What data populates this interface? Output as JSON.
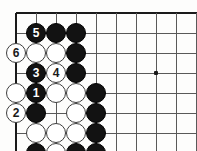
{
  "diagram": {
    "kind": "go-board-diagram",
    "board": {
      "origin_x": 16,
      "origin_y": 13,
      "spacing": 20,
      "cols": 10,
      "rows": 7,
      "left_edge": true,
      "top_edge": true,
      "line_color": "#595959",
      "edge_color": "#1a1a1a",
      "background_color": "#fdfdfc"
    },
    "star_points": [
      {
        "name": "star-point-4-4",
        "col": 7,
        "row": 3
      }
    ],
    "colors": {
      "black_stone": "#121212",
      "white_stone": "#ffffff",
      "black_label": "#ffffff",
      "white_label": "#1a1a1a"
    },
    "stones": [
      {
        "name": "stone-black-move-5",
        "color": "black",
        "col": 1,
        "row": 1,
        "label": "5"
      },
      {
        "name": "stone-black-b1",
        "color": "black",
        "col": 2,
        "row": 1,
        "label": ""
      },
      {
        "name": "stone-black-b2",
        "color": "black",
        "col": 3,
        "row": 1,
        "label": ""
      },
      {
        "name": "stone-white-move-6",
        "color": "white",
        "col": 0,
        "row": 2,
        "label": "6"
      },
      {
        "name": "stone-white-w1",
        "color": "white",
        "col": 1,
        "row": 2,
        "label": ""
      },
      {
        "name": "stone-white-w2",
        "color": "white",
        "col": 2,
        "row": 2,
        "label": ""
      },
      {
        "name": "stone-black-b3",
        "color": "black",
        "col": 3,
        "row": 2,
        "label": ""
      },
      {
        "name": "stone-black-move-3",
        "color": "black",
        "col": 1,
        "row": 3,
        "label": "3"
      },
      {
        "name": "stone-white-move-4",
        "color": "white",
        "col": 2,
        "row": 3,
        "label": "4"
      },
      {
        "name": "stone-black-b4",
        "color": "black",
        "col": 3,
        "row": 3,
        "label": ""
      },
      {
        "name": "stone-white-w3",
        "color": "white",
        "col": 0,
        "row": 4,
        "label": ""
      },
      {
        "name": "stone-black-move-1",
        "color": "black",
        "col": 1,
        "row": 4,
        "label": "1"
      },
      {
        "name": "stone-white-w4",
        "color": "white",
        "col": 2,
        "row": 4,
        "label": ""
      },
      {
        "name": "stone-white-w5",
        "color": "white",
        "col": 3,
        "row": 4,
        "label": ""
      },
      {
        "name": "stone-black-b5",
        "color": "black",
        "col": 4,
        "row": 4,
        "label": ""
      },
      {
        "name": "stone-white-move-2",
        "color": "white",
        "col": 0,
        "row": 5,
        "label": "2"
      },
      {
        "name": "stone-black-b6",
        "color": "black",
        "col": 1,
        "row": 5,
        "label": ""
      },
      {
        "name": "stone-white-w6",
        "color": "white",
        "col": 3,
        "row": 5,
        "label": ""
      },
      {
        "name": "stone-black-b7",
        "color": "black",
        "col": 4,
        "row": 5,
        "label": ""
      },
      {
        "name": "stone-white-w7",
        "color": "white",
        "col": 1,
        "row": 6,
        "label": ""
      },
      {
        "name": "stone-white-w8",
        "color": "white",
        "col": 2,
        "row": 6,
        "label": ""
      },
      {
        "name": "stone-white-w9",
        "color": "white",
        "col": 3,
        "row": 6,
        "label": ""
      },
      {
        "name": "stone-black-b8",
        "color": "black",
        "col": 4,
        "row": 6,
        "label": ""
      },
      {
        "name": "stone-black-b9",
        "color": "black",
        "col": 1,
        "row": 7,
        "label": ""
      },
      {
        "name": "stone-white-w10",
        "color": "white",
        "col": 2,
        "row": 7,
        "label": ""
      },
      {
        "name": "stone-black-b10",
        "color": "black",
        "col": 3,
        "row": 7,
        "label": ""
      },
      {
        "name": "stone-black-b11",
        "color": "black",
        "col": 4,
        "row": 7,
        "label": ""
      },
      {
        "name": "stone-black-b12",
        "color": "black",
        "col": 1,
        "row": 8,
        "label": ""
      },
      {
        "name": "stone-black-b13",
        "color": "black",
        "col": 2,
        "row": 8,
        "label": ""
      }
    ],
    "move_sequence": [
      {
        "number": "1",
        "color": "black"
      },
      {
        "number": "2",
        "color": "white"
      },
      {
        "number": "3",
        "color": "black"
      },
      {
        "number": "4",
        "color": "white"
      },
      {
        "number": "5",
        "color": "black"
      },
      {
        "number": "6",
        "color": "white"
      }
    ]
  }
}
